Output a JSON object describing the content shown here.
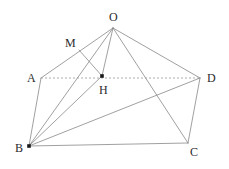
{
  "figure": {
    "kind": "geometry-diagram",
    "background_color": "#ffffff",
    "line_color": "#888888",
    "dotted_line_color": "#9a9a9a",
    "label_color": "#2b2b2b",
    "vertices": [
      {
        "id": "O",
        "label": "O",
        "x": 113,
        "y": 28,
        "label_x": 113,
        "label_y": 17,
        "dot": false
      },
      {
        "id": "M",
        "label": "M",
        "x": 79,
        "y": 50,
        "label_x": 69,
        "label_y": 43,
        "dot": false
      },
      {
        "id": "A",
        "label": "A",
        "x": 41,
        "y": 78,
        "label_x": 31,
        "label_y": 78,
        "dot": false
      },
      {
        "id": "H",
        "label": "H",
        "x": 102,
        "y": 76,
        "label_x": 103,
        "label_y": 90,
        "dot": true
      },
      {
        "id": "D",
        "label": "D",
        "x": 200,
        "y": 78,
        "label_x": 211,
        "label_y": 78,
        "dot": false
      },
      {
        "id": "B",
        "label": "B",
        "x": 29,
        "y": 146,
        "label_x": 19,
        "label_y": 148,
        "dot": true
      },
      {
        "id": "C",
        "label": "C",
        "x": 188,
        "y": 143,
        "label_x": 194,
        "label_y": 152,
        "dot": false
      }
    ],
    "edges": [
      {
        "id": "O-A",
        "from": "O",
        "to": "A",
        "style": "solid"
      },
      {
        "id": "O-B",
        "from": "O",
        "to": "B",
        "style": "solid"
      },
      {
        "id": "O-H",
        "from": "O",
        "to": "H",
        "style": "solid"
      },
      {
        "id": "O-C",
        "from": "O",
        "to": "C",
        "style": "solid"
      },
      {
        "id": "O-D",
        "from": "O",
        "to": "D",
        "style": "solid"
      },
      {
        "id": "A-B",
        "from": "A",
        "to": "B",
        "style": "solid"
      },
      {
        "id": "A-D",
        "from": "A",
        "to": "D",
        "style": "dotted"
      },
      {
        "id": "B-C",
        "from": "B",
        "to": "C",
        "style": "solid"
      },
      {
        "id": "B-D",
        "from": "B",
        "to": "D",
        "style": "solid"
      },
      {
        "id": "B-H",
        "from": "B",
        "to": "H",
        "style": "solid"
      },
      {
        "id": "C-D",
        "from": "C",
        "to": "D",
        "style": "solid"
      },
      {
        "id": "M-H",
        "from": "M",
        "to": "H",
        "style": "solid"
      }
    ]
  }
}
